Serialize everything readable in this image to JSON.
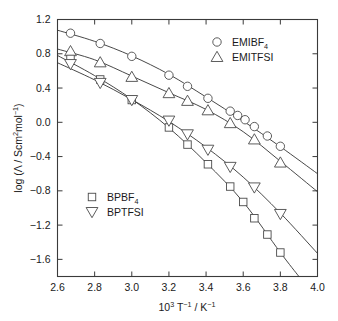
{
  "chart_data": {
    "type": "scatter",
    "title": "",
    "xlabel": "10^3 T^-1 / K^-1",
    "ylabel": "log (Λ / Scm^2mol^-1)",
    "xlim": [
      2.6,
      4.0
    ],
    "ylim": [
      -1.8,
      1.2
    ],
    "xticks": [
      "2.6",
      "2.8",
      "3.0",
      "3.2",
      "3.4",
      "3.6",
      "3.8",
      "4.0"
    ],
    "xtick_values": [
      2.6,
      2.8,
      3.0,
      3.2,
      3.4,
      3.6,
      3.8,
      4.0
    ],
    "yticks": [
      "1.2",
      "0.8",
      "0.4",
      "0.0",
      "−0.4",
      "−0.8",
      "−1.2",
      "−1.6"
    ],
    "ytick_values": [
      1.2,
      0.8,
      0.4,
      0.0,
      -0.4,
      -0.8,
      -1.2,
      -1.6
    ],
    "grid": false,
    "legend_position": "upper-right and middle-left",
    "series": [
      {
        "name": "EMIBF4",
        "marker": "circle",
        "x": [
          2.67,
          2.83,
          3.0,
          3.2,
          3.3,
          3.41,
          3.53,
          3.57,
          3.61,
          3.66,
          3.73,
          3.8
        ],
        "y": [
          1.04,
          0.92,
          0.77,
          0.55,
          0.42,
          0.28,
          0.13,
          0.08,
          0.03,
          -0.05,
          -0.16,
          -0.28
        ],
        "fit_x": [
          2.6,
          2.8,
          3.0,
          3.2,
          3.4,
          3.6,
          3.8,
          4.0
        ],
        "fit_y": [
          1.075,
          0.945,
          0.775,
          0.56,
          0.295,
          0.015,
          -0.285,
          -0.6
        ]
      },
      {
        "name": "EMITFSI",
        "marker": "triangle-up",
        "x": [
          2.67,
          2.83,
          3.0,
          3.2,
          3.3,
          3.41,
          3.53,
          3.66,
          3.8
        ],
        "y": [
          0.83,
          0.7,
          0.53,
          0.34,
          0.25,
          0.14,
          -0.01,
          -0.2,
          -0.47
        ],
        "fit_x": [
          2.6,
          2.8,
          3.0,
          3.2,
          3.4,
          3.6,
          3.8,
          4.0
        ],
        "fit_y": [
          0.855,
          0.73,
          0.54,
          0.345,
          0.15,
          -0.11,
          -0.455,
          -0.81
        ]
      },
      {
        "name": "BPBF4",
        "marker": "square",
        "x": [
          2.67,
          2.83,
          3.0,
          3.2,
          3.3,
          3.41,
          3.53,
          3.6,
          3.66,
          3.73,
          3.8
        ],
        "y": [
          0.74,
          0.5,
          0.26,
          -0.06,
          -0.26,
          -0.49,
          -0.75,
          -0.93,
          -1.12,
          -1.31,
          -1.52
        ],
        "fit_x": [
          2.6,
          2.8,
          3.0,
          3.2,
          3.4,
          3.6,
          3.8,
          3.9
        ],
        "fit_y": [
          0.78,
          0.545,
          0.27,
          -0.065,
          -0.47,
          -0.93,
          -1.52,
          -1.8
        ]
      },
      {
        "name": "BPTFSI",
        "marker": "triangle-down",
        "x": [
          2.67,
          2.83,
          3.0,
          3.2,
          3.3,
          3.41,
          3.53,
          3.66,
          3.8
        ],
        "y": [
          0.68,
          0.46,
          0.26,
          0.02,
          -0.14,
          -0.32,
          -0.52,
          -0.76,
          -1.07
        ],
        "fit_x": [
          2.6,
          2.8,
          3.0,
          3.2,
          3.4,
          3.6,
          3.8,
          4.0
        ],
        "fit_y": [
          0.695,
          0.495,
          0.265,
          0.01,
          -0.29,
          -0.64,
          -1.06,
          -1.53
        ]
      }
    ]
  },
  "axes": {
    "x_label_main": "10",
    "x_label_exp": "3",
    "x_label_t": " T",
    "x_label_t_exp": "−1",
    "x_label_div": " / K",
    "x_label_k_exp": "−1",
    "y_label_prefix": "log (Λ / Scm",
    "y_label_sup2": "2",
    "y_label_mid": "mol",
    "y_label_sup_neg1": "−1",
    "y_label_suffix": ")"
  },
  "legend_top": {
    "items": [
      {
        "label_base": "EMIBF",
        "label_sub": "4",
        "marker": "circle"
      },
      {
        "label_base": "EMITFSI",
        "label_sub": "",
        "marker": "triangle-up"
      }
    ]
  },
  "legend_bottom": {
    "items": [
      {
        "label_base": "BPBF",
        "label_sub": "4",
        "marker": "square"
      },
      {
        "label_base": "BPTFSI",
        "label_sub": "",
        "marker": "triangle-down"
      }
    ]
  },
  "colors": {
    "axis": "#3a3a3a",
    "curve": "#333333",
    "marker_stroke": "#4a4a4a",
    "marker_fill": "#ffffff",
    "background": "#ffffff",
    "text": "#1a1a1a"
  }
}
